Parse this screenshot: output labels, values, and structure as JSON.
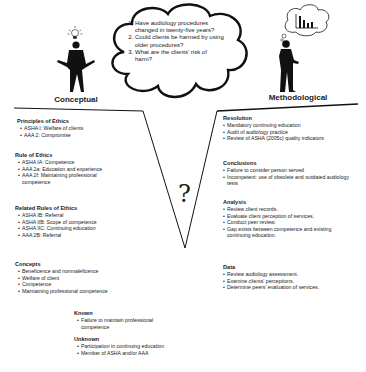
{
  "left_figure": {
    "label": "Conceptual",
    "icon": "lightbulb-icon"
  },
  "right_figure": {
    "label": "Methodological",
    "icon": "bar-chart-thought-icon"
  },
  "cloud": {
    "questions": [
      "Have audiology procedures changed in twenty-five years?",
      "Could clients be harmed by using older procedures?",
      "What are the clients' risk of harm?"
    ]
  },
  "center_symbol": "?",
  "left_sections": [
    {
      "title": "Principles of Ethics",
      "items": [
        "ASHA I: Welfare of clients",
        "AAA 2: Compromise"
      ]
    },
    {
      "title": "Rule of Ethics",
      "items": [
        "ASHA IA: Competence",
        "AAA 2a: Education and experience",
        "AAA 2f: Maintaining professional competence"
      ]
    },
    {
      "title": "Related Rules of Ethics",
      "items": [
        "ASHA IB: Referral",
        "ASHA IIB: Scope of competence",
        "ASHA IIC: Continuing education",
        "AAA 2B: Referral"
      ]
    },
    {
      "title": "Concepts",
      "items": [
        "Beneficence and nonmaleficence",
        "Welfare of client",
        "Competence",
        "Maintaining professional competence"
      ]
    }
  ],
  "bottom_sections": [
    {
      "title": "Known",
      "items": [
        "Failure to maintain professional competence"
      ]
    },
    {
      "title": "Unknown",
      "items": [
        "Participation in continuing education",
        "Member of ASHA and/or AAA"
      ]
    }
  ],
  "right_sections": [
    {
      "title": "Resolution",
      "items": [
        "Mandatory continuing education",
        "Audit of audiology practice",
        "Review of ASHA (2005c) quality indicators"
      ]
    },
    {
      "title": "Conclusions",
      "items": [
        "Failure to consider person served",
        "Incompetent: use of obsolete and outdated audiology tests"
      ]
    },
    {
      "title": "Analysis",
      "items": [
        "Review client records.",
        "Evaluate client perception of services.",
        "Conduct peer review.",
        "Gap exists between competence and existing continuing education."
      ]
    },
    {
      "title": "Data",
      "items": [
        "Review audiology assessment.",
        "Examine clients' perceptions.",
        "Determine peers' evaluation of services."
      ]
    }
  ]
}
